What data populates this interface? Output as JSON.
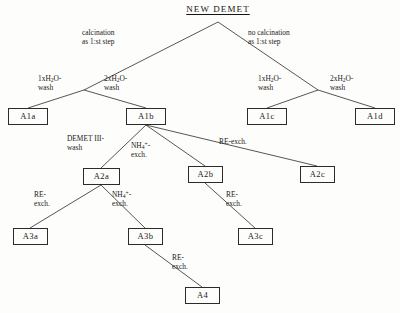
{
  "diagram": {
    "type": "tree",
    "title": "NEW DEMET",
    "root": {
      "label": "NEW DEMET",
      "x": 218,
      "y": 11
    },
    "nodes": [
      {
        "id": "A1a",
        "label": "A1a",
        "x": 8,
        "y": 108,
        "w": 40,
        "h": 17
      },
      {
        "id": "A1b",
        "label": "A1b",
        "x": 126,
        "y": 108,
        "w": 40,
        "h": 17
      },
      {
        "id": "A1c",
        "label": "A1c",
        "x": 247,
        "y": 108,
        "w": 40,
        "h": 17
      },
      {
        "id": "A1d",
        "label": "A1d",
        "x": 355,
        "y": 108,
        "w": 40,
        "h": 17
      },
      {
        "id": "A2a",
        "label": "A2a",
        "x": 83,
        "y": 168,
        "w": 37,
        "h": 17
      },
      {
        "id": "A2b",
        "label": "A2b",
        "x": 188,
        "y": 166,
        "w": 35,
        "h": 17
      },
      {
        "id": "A2c",
        "label": "A2c",
        "x": 300,
        "y": 166,
        "w": 35,
        "h": 17
      },
      {
        "id": "A3a",
        "label": "A3a",
        "x": 13,
        "y": 228,
        "w": 35,
        "h": 17
      },
      {
        "id": "A3b",
        "label": "A3b",
        "x": 128,
        "y": 228,
        "w": 35,
        "h": 17
      },
      {
        "id": "A3c",
        "label": "A3c",
        "x": 238,
        "y": 228,
        "w": 35,
        "h": 17
      },
      {
        "id": "A4",
        "label": "A4",
        "x": 185,
        "y": 287,
        "w": 35,
        "h": 17
      }
    ],
    "edges": [
      {
        "from": "NEW DEMET",
        "to": "A1a-branch",
        "x1": 218,
        "y1": 22,
        "x2": 84,
        "y2": 90
      },
      {
        "from": "NEW DEMET",
        "to": "A1c-branch",
        "x1": 218,
        "y1": 22,
        "x2": 318,
        "y2": 90
      },
      {
        "from": "branch-left",
        "to": "A1a",
        "x1": 84,
        "y1": 90,
        "x2": 28,
        "y2": 108
      },
      {
        "from": "branch-left",
        "to": "A1b",
        "x1": 84,
        "y1": 90,
        "x2": 146,
        "y2": 108
      },
      {
        "from": "branch-right",
        "to": "A1c",
        "x1": 318,
        "y1": 90,
        "x2": 267,
        "y2": 108
      },
      {
        "from": "branch-right",
        "to": "A1d",
        "x1": 318,
        "y1": 90,
        "x2": 375,
        "y2": 108
      },
      {
        "from": "A1b",
        "to": "A2a",
        "x1": 146,
        "y1": 125,
        "x2": 101,
        "y2": 168
      },
      {
        "from": "A1b",
        "to": "A2b",
        "x1": 146,
        "y1": 125,
        "x2": 205,
        "y2": 166
      },
      {
        "from": "A1b",
        "to": "A2c",
        "x1": 146,
        "y1": 125,
        "x2": 317,
        "y2": 166
      },
      {
        "from": "A2a",
        "to": "A3a",
        "x1": 101,
        "y1": 185,
        "x2": 30,
        "y2": 228
      },
      {
        "from": "A2a",
        "to": "A3b",
        "x1": 101,
        "y1": 185,
        "x2": 145,
        "y2": 228
      },
      {
        "from": "A2b",
        "to": "A3c",
        "x1": 205,
        "y1": 183,
        "x2": 255,
        "y2": 228
      },
      {
        "from": "A3b",
        "to": "A4",
        "x1": 145,
        "y1": 245,
        "x2": 202,
        "y2": 287
      }
    ],
    "edge_labels": [
      {
        "id": "calcination-left",
        "lines": [
          "calcination",
          "as 1:st step"
        ],
        "x": 82,
        "y": 28,
        "align": "left"
      },
      {
        "id": "no-calcination-right",
        "lines": [
          "no calcination",
          "as 1:st step"
        ],
        "x": 248,
        "y": 28,
        "align": "left"
      },
      {
        "id": "wash-1x-left",
        "lines": [
          "1xH2O-",
          "wash"
        ],
        "html": [
          "1xH<sub>2</sub>O-",
          "wash"
        ],
        "x": 38,
        "y": 74,
        "align": "left"
      },
      {
        "id": "wash-2x-left",
        "lines": [
          "2xH2O-",
          "wash"
        ],
        "html": [
          "2xH<sub>2</sub>O-",
          "wash"
        ],
        "x": 104,
        "y": 74,
        "align": "left"
      },
      {
        "id": "wash-1x-right",
        "lines": [
          "1xH2O-",
          "wash"
        ],
        "html": [
          "1xH<sub>2</sub>O-",
          "wash"
        ],
        "x": 258,
        "y": 74,
        "align": "left"
      },
      {
        "id": "wash-2x-right",
        "lines": [
          "2xH2O-",
          "wash"
        ],
        "html": [
          "2xH<sub>2</sub>O-",
          "wash"
        ],
        "x": 330,
        "y": 74,
        "align": "left"
      },
      {
        "id": "demet-iii-wash",
        "lines": [
          "DEMET III-",
          "wash"
        ],
        "html": [
          "DEMET III-",
          "wash"
        ],
        "x": 67,
        "y": 134,
        "align": "left"
      },
      {
        "id": "nh4-exch-a1b",
        "lines": [
          "NH4+-",
          "exch."
        ],
        "html": [
          "NH<sub>4</sub><sup>+</sup>-",
          "exch."
        ],
        "x": 131,
        "y": 141,
        "align": "left"
      },
      {
        "id": "re-exch-a2c",
        "lines": [
          "RE-exch."
        ],
        "html": [
          "RE-exch."
        ],
        "x": 219,
        "y": 137,
        "align": "left"
      },
      {
        "id": "re-exch-a3a",
        "lines": [
          "RE-",
          "exch."
        ],
        "html": [
          "RE-",
          "exch."
        ],
        "x": 34,
        "y": 190,
        "align": "left"
      },
      {
        "id": "nh4-exch-a3b",
        "lines": [
          "NH4+-",
          "exch."
        ],
        "html": [
          "NH<sub>4</sub><sup>+</sup>-",
          "exch."
        ],
        "x": 112,
        "y": 190,
        "align": "left"
      },
      {
        "id": "re-exch-a3c",
        "lines": [
          "RE-",
          "exch."
        ],
        "html": [
          "RE-",
          "exch."
        ],
        "x": 226,
        "y": 190,
        "align": "left"
      },
      {
        "id": "re-exch-a4",
        "lines": [
          "RE-",
          "exch."
        ],
        "html": [
          "RE-",
          "exch."
        ],
        "x": 172,
        "y": 253,
        "align": "left"
      }
    ],
    "colors": {
      "line": "#2b2b2b",
      "text": "#1a1a1a",
      "background": "#fdfdfb"
    }
  }
}
